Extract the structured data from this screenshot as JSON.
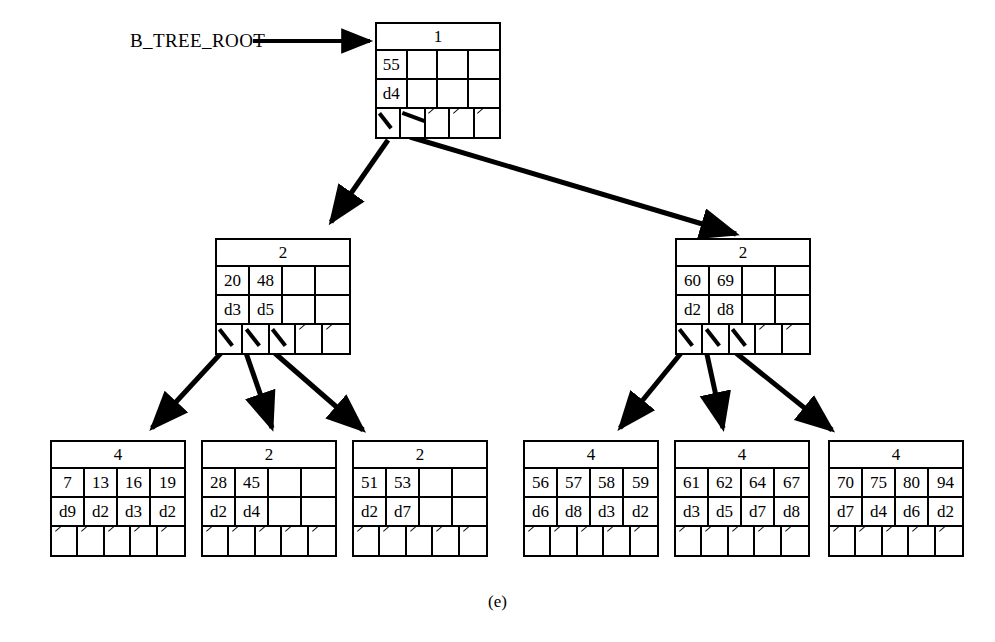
{
  "figure": {
    "caption": "(e)",
    "root_label": "B_TREE_ROOT"
  },
  "tree": {
    "root": {
      "id": "root",
      "count": "1",
      "keys": [
        "55",
        "",
        "",
        ""
      ],
      "data": [
        "d4",
        "",
        "",
        ""
      ],
      "pointers": [
        "live",
        "live",
        "null",
        "null",
        "null"
      ]
    },
    "internal_left": {
      "id": "internal-left",
      "count": "2",
      "keys": [
        "20",
        "48",
        "",
        ""
      ],
      "data": [
        "d3",
        "d5",
        "",
        ""
      ],
      "pointers": [
        "live",
        "live",
        "live",
        "null",
        "null"
      ]
    },
    "internal_right": {
      "id": "internal-right",
      "count": "2",
      "keys": [
        "60",
        "69",
        "",
        ""
      ],
      "data": [
        "d2",
        "d8",
        "",
        ""
      ],
      "pointers": [
        "live",
        "live",
        "live",
        "null",
        "null"
      ]
    },
    "leaves": [
      {
        "id": "leaf-1",
        "count": "4",
        "keys": [
          "7",
          "13",
          "16",
          "19"
        ],
        "data": [
          "d9",
          "d2",
          "d3",
          "d2"
        ],
        "pointers": [
          "null",
          "null",
          "null",
          "null",
          "null"
        ]
      },
      {
        "id": "leaf-2",
        "count": "2",
        "keys": [
          "28",
          "45",
          "",
          ""
        ],
        "data": [
          "d2",
          "d4",
          "",
          ""
        ],
        "pointers": [
          "null",
          "null",
          "null",
          "null",
          "null"
        ]
      },
      {
        "id": "leaf-3",
        "count": "2",
        "keys": [
          "51",
          "53",
          "",
          ""
        ],
        "data": [
          "d2",
          "d7",
          "",
          ""
        ],
        "pointers": [
          "null",
          "null",
          "null",
          "null",
          "null"
        ]
      },
      {
        "id": "leaf-4",
        "count": "4",
        "keys": [
          "56",
          "57",
          "58",
          "59"
        ],
        "data": [
          "d6",
          "d8",
          "d3",
          "d2"
        ],
        "pointers": [
          "null",
          "null",
          "null",
          "null",
          "null"
        ]
      },
      {
        "id": "leaf-5",
        "count": "4",
        "keys": [
          "61",
          "62",
          "64",
          "67"
        ],
        "data": [
          "d3",
          "d5",
          "d7",
          "d8"
        ],
        "pointers": [
          "null",
          "null",
          "null",
          "null",
          "null"
        ]
      },
      {
        "id": "leaf-6",
        "count": "4",
        "keys": [
          "70",
          "75",
          "80",
          "94"
        ],
        "data": [
          "d7",
          "d4",
          "d6",
          "d2"
        ],
        "pointers": [
          "null",
          "null",
          "null",
          "null",
          "null"
        ]
      }
    ]
  },
  "colors": {
    "ink": "#000000",
    "paper": "#ffffff"
  }
}
